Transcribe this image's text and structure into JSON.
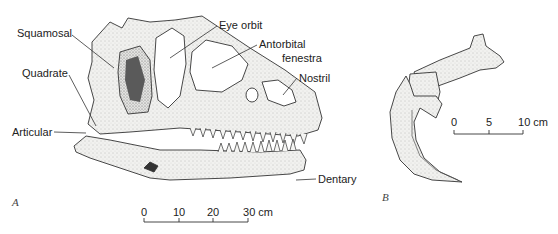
{
  "figure": {
    "panels": [
      {
        "id": "A",
        "label": "A",
        "subject": "skull"
      },
      {
        "id": "B",
        "label": "B",
        "subject": "claw"
      }
    ],
    "labels": {
      "squamosal": "Squamosal",
      "quadrate": "Quadrate",
      "articular": "Articular",
      "eye_orbit": "Eye orbit",
      "antorbital_line1": "Antorbital",
      "antorbital_line2": "fenestra",
      "nostril": "Nostril",
      "dentary": "Dentary"
    },
    "scale_a": {
      "ticks": [
        "0",
        "10",
        "20",
        "30 cm"
      ]
    },
    "scale_b": {
      "ticks": [
        "0",
        "5",
        "10 cm"
      ]
    }
  }
}
